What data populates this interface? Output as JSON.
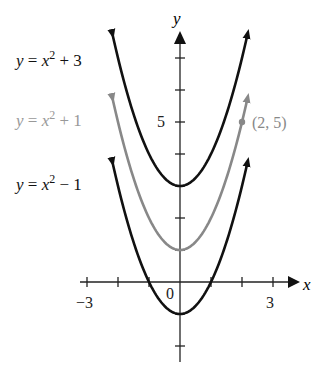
{
  "chart_data": {
    "type": "line",
    "title": "",
    "xlabel": "x",
    "ylabel": "y",
    "xlim": [
      -3.5,
      3.6
    ],
    "ylim": [
      -2.5,
      8
    ],
    "x_ticks": [
      -3,
      -2,
      -1,
      1,
      2,
      3
    ],
    "x_tick_labels": {
      "-3": "−3",
      "3": "3"
    },
    "y_ticks": [
      -2,
      -1,
      1,
      2,
      3,
      4,
      5,
      6,
      7
    ],
    "y_tick_labels": {
      "5": "5"
    },
    "origin_label": "0",
    "grid": false,
    "series": [
      {
        "name": "y = x² + 3",
        "expr": "x^2 + 3",
        "shift": 3,
        "color": "#111111",
        "x_range": [
          -2.18,
          2.18
        ]
      },
      {
        "name": "y = x² + 1",
        "expr": "x^2 + 1",
        "shift": 1,
        "color": "#888888",
        "x_range": [
          -2.18,
          2.18
        ]
      },
      {
        "name": "y = x² − 1",
        "expr": "x^2 - 1",
        "shift": -1,
        "color": "#111111",
        "x_range": [
          -2.18,
          2.18
        ]
      }
    ],
    "annotations": [
      {
        "type": "point",
        "x": 2,
        "y": 5,
        "label": "(2, 5)",
        "color": "#888888"
      }
    ]
  },
  "labels": {
    "curve_top": {
      "lhs": "y",
      "eq": " = ",
      "var": "x",
      "exp": "2",
      "rest": " + 3"
    },
    "curve_mid": {
      "lhs": "y",
      "eq": " = ",
      "var": "x",
      "exp": "2",
      "rest": " + 1"
    },
    "curve_bot": {
      "lhs": "y",
      "eq": " = ",
      "var": "x",
      "exp": "2",
      "rest": " − 1"
    },
    "x_axis": "x",
    "y_axis": "y",
    "tick_neg3": "−3",
    "tick_3": "3",
    "tick_5": "5",
    "origin": "0",
    "point": "(2, 5)"
  }
}
